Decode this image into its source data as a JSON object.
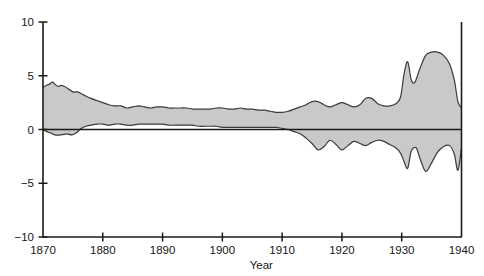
{
  "chart_data": {
    "type": "area",
    "title": "",
    "subtitle": "",
    "xlabel": "Year",
    "ylabel": "",
    "xlim": [
      1870,
      1940
    ],
    "ylim": [
      -10,
      10
    ],
    "grid": false,
    "legend": null,
    "band_fill_color": "#c9c9c9",
    "band_stroke_color": "#3a3a3a",
    "axis_color": "#1a1a1a",
    "zero_line": 0,
    "x_ticks": [
      1870,
      1880,
      1890,
      1900,
      1910,
      1920,
      1930,
      1940
    ],
    "x_tick_labels": [
      "1870",
      "1880",
      "1890",
      "1900",
      "1910",
      "1920",
      "1930",
      "1940"
    ],
    "y_ticks": [
      -10,
      -5,
      0,
      5,
      10
    ],
    "y_tick_labels": [
      "-10",
      "-5",
      "0",
      "5",
      "10"
    ],
    "series": [
      {
        "name": "upper",
        "x": [
          1870,
          1870.5,
          1871,
          1871.6,
          1872,
          1872.6,
          1873,
          1873.6,
          1874.2,
          1875,
          1875.8,
          1876.5,
          1877.2,
          1878,
          1879,
          1880,
          1881,
          1882,
          1883,
          1884,
          1885,
          1886,
          1887,
          1888,
          1889,
          1890,
          1891,
          1892,
          1893,
          1894,
          1895,
          1896,
          1897,
          1898,
          1899,
          1900,
          1901,
          1902,
          1903,
          1904,
          1905,
          1906,
          1907,
          1908,
          1909,
          1910,
          1911,
          1912,
          1913,
          1914,
          1915,
          1916,
          1917,
          1918,
          1919,
          1920,
          1921,
          1922,
          1923,
          1924,
          1925,
          1926,
          1927,
          1928,
          1929,
          1929.8,
          1930.4,
          1931,
          1931.6,
          1932.2,
          1933,
          1934,
          1935,
          1936,
          1937,
          1938,
          1938.8,
          1939.4,
          1940
        ],
        "values": [
          3.9,
          4.1,
          4.2,
          4.4,
          4.2,
          4.0,
          4.1,
          4.0,
          3.8,
          3.5,
          3.5,
          3.3,
          3.1,
          2.9,
          2.7,
          2.5,
          2.3,
          2.2,
          2.2,
          2.0,
          2.1,
          2.2,
          2.1,
          2.0,
          2.1,
          2.1,
          2.0,
          2.0,
          2.0,
          2.0,
          1.9,
          1.9,
          1.9,
          1.9,
          2.0,
          2.0,
          1.9,
          1.9,
          2.0,
          1.9,
          1.9,
          1.8,
          1.8,
          1.7,
          1.6,
          1.6,
          1.7,
          1.9,
          2.1,
          2.3,
          2.6,
          2.6,
          2.3,
          2.1,
          2.3,
          2.5,
          2.3,
          2.1,
          2.3,
          2.9,
          2.9,
          2.4,
          2.2,
          2.2,
          2.4,
          3.0,
          5.2,
          6.3,
          4.6,
          4.4,
          5.6,
          6.9,
          7.2,
          7.2,
          6.9,
          6.1,
          4.6,
          2.6,
          2.0
        ],
        "description": "upper bound of shaded band"
      },
      {
        "name": "lower",
        "x": [
          1870,
          1870.6,
          1871.2,
          1872,
          1873,
          1874,
          1874.8,
          1875.6,
          1876.4,
          1877.2,
          1878,
          1879,
          1880,
          1881,
          1882,
          1883,
          1884,
          1885,
          1886,
          1887,
          1888,
          1889,
          1890,
          1891,
          1892,
          1893,
          1894,
          1895,
          1896,
          1897,
          1898,
          1899,
          1900,
          1901,
          1902,
          1903,
          1904,
          1905,
          1906,
          1907,
          1908,
          1909,
          1910,
          1911,
          1912,
          1913,
          1914,
          1915,
          1916,
          1917,
          1918,
          1919,
          1920,
          1921,
          1922,
          1923,
          1924,
          1925,
          1926,
          1927,
          1928,
          1929,
          1929.8,
          1930.4,
          1931,
          1931.6,
          1932.4,
          1933,
          1934,
          1935,
          1936,
          1937,
          1938,
          1938.8,
          1939.4,
          1940
        ],
        "values": [
          0.0,
          -0.2,
          -0.3,
          -0.5,
          -0.5,
          -0.4,
          -0.5,
          -0.3,
          0.1,
          0.3,
          0.4,
          0.5,
          0.5,
          0.4,
          0.5,
          0.5,
          0.4,
          0.4,
          0.5,
          0.5,
          0.5,
          0.5,
          0.5,
          0.4,
          0.4,
          0.4,
          0.4,
          0.4,
          0.3,
          0.3,
          0.3,
          0.3,
          0.2,
          0.2,
          0.2,
          0.2,
          0.2,
          0.2,
          0.2,
          0.2,
          0.2,
          0.2,
          0.1,
          0.0,
          -0.2,
          -0.4,
          -0.8,
          -1.3,
          -1.9,
          -1.6,
          -1.0,
          -1.4,
          -1.9,
          -1.5,
          -1.1,
          -1.3,
          -1.5,
          -1.2,
          -1.0,
          -1.1,
          -1.4,
          -1.7,
          -2.2,
          -3.0,
          -3.6,
          -2.0,
          -1.7,
          -2.6,
          -3.9,
          -3.1,
          -2.1,
          -1.6,
          -1.5,
          -2.3,
          -3.8,
          -1.7
        ],
        "description": "lower bound of shaded band"
      }
    ]
  }
}
